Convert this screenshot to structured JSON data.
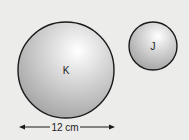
{
  "diagram": {
    "circles": [
      {
        "label": "K",
        "cx": 66,
        "cy": 70,
        "r": 48
      },
      {
        "label": "J",
        "cx": 153,
        "cy": 46,
        "r": 24
      }
    ],
    "dimension": {
      "label": "12 cm",
      "target": "K",
      "x1": 20,
      "x2": 114,
      "y": 127
    }
  }
}
